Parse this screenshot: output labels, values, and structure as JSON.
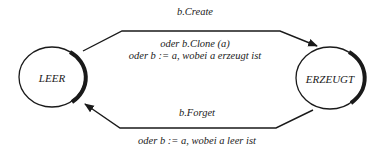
{
  "diagram": {
    "type": "state-transition",
    "colors": {
      "stroke": "#1a1a1a",
      "background": "#ffffff"
    },
    "states": [
      {
        "id": "leer",
        "label": "LEER"
      },
      {
        "id": "erzeugt",
        "label": "ERZEUGT"
      }
    ],
    "transitions": [
      {
        "from": "LEER",
        "to": "ERZEUGT",
        "label_top": "b.Create",
        "label_lines": [
          "oder b.Clone (a)",
          "oder b := a, wobei a erzeugt ist"
        ]
      },
      {
        "from": "ERZEUGT",
        "to": "LEER",
        "label_top": "b.Forget",
        "label_lines": [
          "oder b := a, wobei a leer ist"
        ]
      }
    ]
  }
}
